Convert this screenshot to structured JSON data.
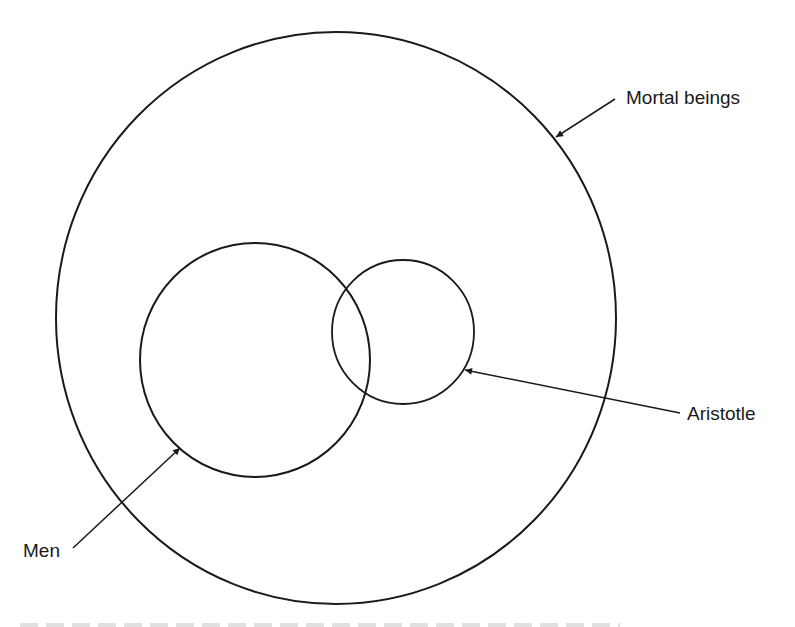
{
  "diagram": {
    "type": "euler-diagram",
    "sets": [
      {
        "id": "mortal",
        "label": "Mortal beings",
        "cx": 336,
        "cy": 318,
        "rx": 280,
        "ry": 286
      },
      {
        "id": "men",
        "label": "Men",
        "cx": 255,
        "cy": 360,
        "rx": 115,
        "ry": 117
      },
      {
        "id": "aristotle",
        "label": "Aristotle",
        "cx": 403,
        "cy": 332,
        "rx": 71,
        "ry": 72
      }
    ],
    "arrows": [
      {
        "id": "mortal-arrow",
        "from": [
          615,
          99
        ],
        "to": [
          556,
          137
        ]
      },
      {
        "id": "aristotle-arrow",
        "from": [
          680,
          413
        ],
        "to": [
          465,
          370
        ]
      },
      {
        "id": "men-arrow",
        "from": [
          73,
          548
        ],
        "to": [
          180,
          448
        ]
      }
    ],
    "labels": {
      "mortal": "Mortal beings",
      "aristotle": "Aristotle",
      "men": "Men"
    },
    "stroke_color": "#1a1a1a"
  }
}
